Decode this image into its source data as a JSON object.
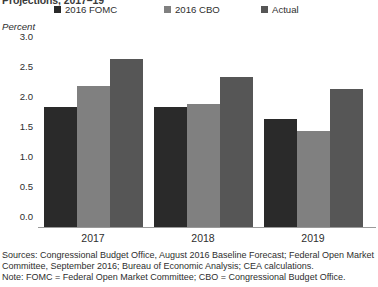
{
  "chart_data": {
    "type": "bar",
    "title": "Projections, 2017–19",
    "subtitle": "",
    "xlabel": "",
    "ylabel": "Percent",
    "categories": [
      "2017",
      "2018",
      "2019"
    ],
    "series": [
      {
        "name": "2016 FOMC",
        "values": [
          2.0,
          2.0,
          1.8
        ],
        "color": "#2a2a2a"
      },
      {
        "name": "2016 CBO",
        "values": [
          2.35,
          2.05,
          1.6
        ],
        "color": "#808080"
      },
      {
        "name": "Actual",
        "values": [
          2.8,
          2.5,
          2.3
        ],
        "color": "#565656"
      }
    ],
    "ylim": [
      0.0,
      3.0
    ],
    "yticks": [
      "3.0",
      "2.5",
      "2.0",
      "1.5",
      "1.0",
      "0.5",
      "0.0"
    ],
    "ytick_values": [
      3.0,
      2.5,
      2.0,
      1.5,
      1.0,
      0.5,
      0.0
    ],
    "grid": false,
    "legend_position": "top"
  },
  "legend": {
    "items": [
      {
        "label": "2016 FOMC",
        "color": "#2a2a2a"
      },
      {
        "label": "2016 CBO",
        "color": "#808080"
      },
      {
        "label": "Actual",
        "color": "#565656"
      }
    ]
  },
  "axes": {
    "unit_label": "Percent"
  },
  "footnotes": {
    "sources_line1": "Sources: Congressional Budget Office, August 2016 Baseline Forecast; Federal Open Market",
    "sources_line2": "Committee, September 2016; Bureau of Economic Analysis; CEA calculations.",
    "note": "Note: FOMC = Federal Open Market Committee; CBO = Congressional Budget Office."
  }
}
